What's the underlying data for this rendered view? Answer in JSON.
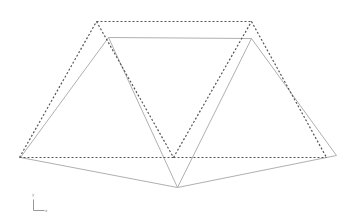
{
  "diagram": {
    "type": "truss deformation plot",
    "undeformed": {
      "style": "dashed",
      "color": "#555555",
      "nodes": [
        [
          19,
          157
        ],
        [
          96,
          21
        ],
        [
          173,
          157
        ],
        [
          251,
          21
        ],
        [
          326,
          157
        ]
      ],
      "edges": [
        [
          0,
          1
        ],
        [
          1,
          2
        ],
        [
          2,
          3
        ],
        [
          3,
          4
        ],
        [
          1,
          3
        ],
        [
          0,
          2
        ],
        [
          2,
          4
        ]
      ]
    },
    "deformed": {
      "style": "solid",
      "color": "#b0b0b0",
      "nodes": [
        [
          20,
          157
        ],
        [
          108,
          37
        ],
        [
          177,
          187
        ],
        [
          251,
          38
        ],
        [
          336,
          155
        ]
      ],
      "edges": [
        [
          0,
          1
        ],
        [
          1,
          2
        ],
        [
          2,
          3
        ],
        [
          3,
          4
        ],
        [
          1,
          3
        ],
        [
          0,
          2
        ],
        [
          2,
          4
        ]
      ]
    },
    "axis_triad": {
      "origin": [
        33,
        210
      ],
      "x_label": "x",
      "y_label": "y",
      "color": "#999999"
    }
  }
}
